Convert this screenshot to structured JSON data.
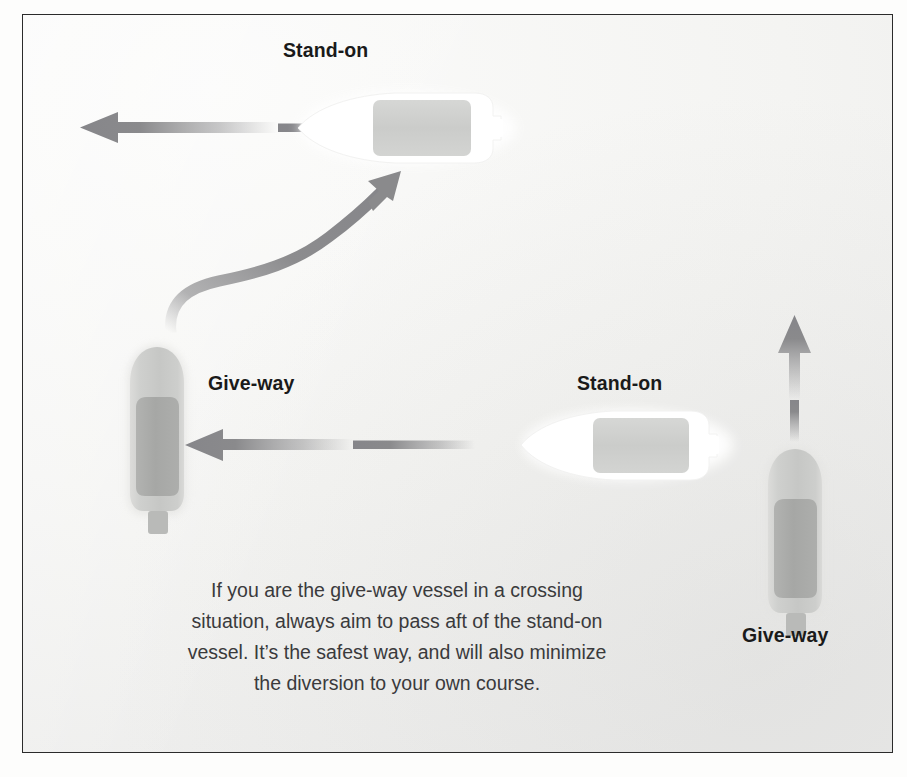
{
  "diagram": {
    "background_color": "#f4f4f2",
    "border_color": "#2b2b2b",
    "arrow_color": "#8e8e90",
    "white_hull_color": "#ffffff",
    "gray_hull_color": "#c9cac8",
    "deck_color": "#a9aaa8",
    "labels": {
      "top_standon": "Stand-on",
      "left_giveway": "Give-way",
      "middle_standon": "Stand-on",
      "right_giveway": "Give-way"
    },
    "caption": {
      "line1": "If you are the give-way vessel in a crossing",
      "line2": "situation, always aim to pass aft of the stand-on",
      "line3": "vessel. It’s the safest way, and will also minimize",
      "line4": "the diversion to your own course."
    },
    "vessels": [
      {
        "id": "top-standon-vessel",
        "role": "Stand-on",
        "hull": "white",
        "heading": "west",
        "orientation": "horizontal-left"
      },
      {
        "id": "left-giveway-vessel",
        "role": "Give-way",
        "hull": "gray",
        "heading": "north",
        "orientation": "vertical-up"
      },
      {
        "id": "middle-standon-vessel",
        "role": "Stand-on",
        "hull": "white",
        "heading": "west",
        "orientation": "horizontal-left"
      },
      {
        "id": "right-giveway-vessel",
        "role": "Give-way",
        "hull": "gray",
        "heading": "north",
        "orientation": "vertical-up"
      }
    ],
    "arrows": [
      {
        "id": "top-course-arrow",
        "shape": "straight",
        "direction": "left",
        "fade": "tail"
      },
      {
        "id": "curved-diversion-arrow",
        "shape": "s-curve",
        "direction": "up-right",
        "fade": "tail"
      },
      {
        "id": "middle-course-arrow",
        "shape": "straight",
        "direction": "left",
        "fade": "tail"
      },
      {
        "id": "right-course-arrow",
        "shape": "straight",
        "direction": "up",
        "fade": "tail"
      }
    ]
  }
}
